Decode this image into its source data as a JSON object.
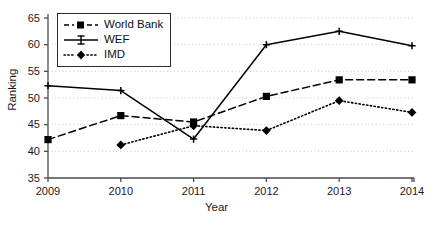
{
  "chart_data": {
    "type": "line",
    "title": "",
    "xlabel": "Year",
    "ylabel": "Ranking",
    "x": [
      2009,
      2010,
      2011,
      2012,
      2013,
      2014
    ],
    "xlim": [
      2009,
      2014
    ],
    "ylim": [
      35,
      65
    ],
    "yticks": [
      35,
      40,
      45,
      50,
      55,
      60,
      65
    ],
    "xticks": [
      2009,
      2010,
      2011,
      2012,
      2013,
      2014
    ],
    "grid": "horizontal-dotted",
    "legend_position": "upper-left-inside",
    "series": [
      {
        "name": "World Bank",
        "marker": "square",
        "linestyle": "dashed",
        "color": "#000000",
        "values": [
          42.2,
          46.7,
          45.5,
          50.3,
          53.4,
          53.4
        ]
      },
      {
        "name": "WEF",
        "marker": "plus",
        "linestyle": "solid",
        "color": "#000000",
        "values": [
          52.3,
          51.4,
          42.3,
          60.0,
          62.5,
          59.8
        ]
      },
      {
        "name": "IMD",
        "marker": "diamond",
        "linestyle": "dotted",
        "color": "#000000",
        "values": [
          null,
          41.2,
          44.8,
          43.9,
          49.5,
          47.3
        ]
      }
    ]
  },
  "axes": {
    "ylabel": "Ranking",
    "xlabel": "Year",
    "ytick_labels": [
      "65",
      "60",
      "55",
      "50",
      "45",
      "40",
      "35"
    ],
    "xtick_labels": [
      "2009",
      "2010",
      "2011",
      "2012",
      "2013",
      "2014"
    ]
  },
  "legend": {
    "items": [
      {
        "label": "World Bank"
      },
      {
        "label": "WEF"
      },
      {
        "label": "IMD"
      }
    ]
  },
  "style": {
    "background": "#ffffff",
    "axis_color": "#4d4d4d",
    "grid_color": "#c8c8c8",
    "line_color": "#000000",
    "text_color": "#1a1a1a"
  }
}
